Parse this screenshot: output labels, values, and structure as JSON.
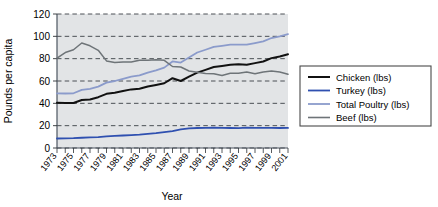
{
  "chart_data": {
    "type": "line",
    "title": "",
    "xlabel": "Year",
    "ylabel": "Pounds per capita",
    "ylim": [
      0,
      120
    ],
    "yticks": [
      0,
      20,
      40,
      60,
      80,
      100,
      120
    ],
    "grid": true,
    "legend_position": "right",
    "x": [
      1973,
      1974,
      1975,
      1976,
      1977,
      1978,
      1979,
      1980,
      1981,
      1982,
      1983,
      1984,
      1985,
      1986,
      1987,
      1988,
      1989,
      1990,
      1991,
      1992,
      1993,
      1994,
      1995,
      1996,
      1997,
      1998,
      1999,
      2000,
      2001
    ],
    "xtick_labels": [
      "1973",
      "1975",
      "1977",
      "1979",
      "1981",
      "1983",
      "1985",
      "1987",
      "1989",
      "1991",
      "1993",
      "1995",
      "1997",
      "1999",
      "2001"
    ],
    "series": [
      {
        "name": "Chicken (lbs)",
        "color": "#111111",
        "width": 2.0,
        "values": [
          40.5,
          40.2,
          40.3,
          43.0,
          43.5,
          45.5,
          48.5,
          49.5,
          51.0,
          52.5,
          53.0,
          55.0,
          56.5,
          58.0,
          62.5,
          60.0,
          64.0,
          67.5,
          70.0,
          72.5,
          73.5,
          74.5,
          75.0,
          74.5,
          76.0,
          77.5,
          80.5,
          82.0,
          84.0
        ]
      },
      {
        "name": "Turkey (lbs)",
        "color": "#2f50b0",
        "width": 1.8,
        "values": [
          8.5,
          8.7,
          8.8,
          9.2,
          9.5,
          9.8,
          10.4,
          10.8,
          11.2,
          11.6,
          12.0,
          12.6,
          13.3,
          14.2,
          15.2,
          16.6,
          17.6,
          17.9,
          18.0,
          18.2,
          18.0,
          17.9,
          17.8,
          18.2,
          18.0,
          18.1,
          18.0,
          17.9,
          18.0
        ]
      },
      {
        "name": "Total Poultry (lbs)",
        "color": "#8b9bcb",
        "width": 1.8,
        "values": [
          49.0,
          48.8,
          49.0,
          52.0,
          53.0,
          55.0,
          58.5,
          60.0,
          62.0,
          64.0,
          65.0,
          67.5,
          69.5,
          72.0,
          77.5,
          76.5,
          81.0,
          85.5,
          88.0,
          90.5,
          91.5,
          92.5,
          92.5,
          92.5,
          94.0,
          95.5,
          98.5,
          100.0,
          102.0
        ]
      },
      {
        "name": "Beef (lbs)",
        "color": "#6e7478",
        "width": 1.5,
        "values": [
          80.5,
          85.5,
          88.0,
          94.0,
          91.5,
          87.5,
          78.0,
          76.5,
          77.0,
          77.0,
          78.5,
          78.5,
          79.0,
          78.5,
          73.0,
          72.5,
          69.0,
          67.8,
          66.8,
          66.5,
          65.0,
          67.0,
          67.0,
          68.0,
          66.5,
          68.0,
          69.0,
          68.0,
          66.0
        ]
      }
    ]
  },
  "legend": {
    "items": [
      {
        "label": "Chicken (lbs)"
      },
      {
        "label": "Turkey (lbs)"
      },
      {
        "label": "Total Poultry (lbs)"
      },
      {
        "label": "Beef (lbs)"
      }
    ]
  },
  "axes": {
    "ylabel": "Pounds per capita",
    "xlabel": "Year"
  },
  "colors": {
    "chicken": "#111111",
    "turkey": "#2f50b0",
    "total_poultry": "#8b9bcb",
    "beef": "#6e7478",
    "plot_background": "#e2e4e6",
    "gridline": "#3a3f45"
  }
}
